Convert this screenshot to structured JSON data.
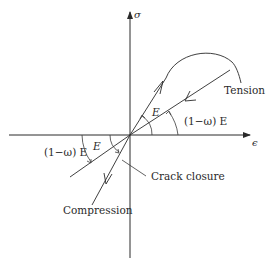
{
  "diagram": {
    "axes": {
      "y_label": "σ",
      "x_label": "ϵ"
    },
    "labels": {
      "tension": "Tension",
      "compression": "Compression",
      "crack_closure": "Crack closure",
      "slope_E_tension": "E",
      "slope_damaged_tension": "(1−ω) E",
      "slope_E_compression": "E",
      "slope_damaged_compression": "(1−ω) E"
    },
    "colors": {
      "ink": "#2a2a2a",
      "background": "#ffffff"
    }
  }
}
